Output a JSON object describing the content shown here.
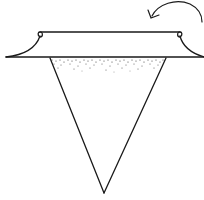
{
  "diagram": {
    "type": "line-illustration",
    "colors": {
      "stroke": "#1a1a1a",
      "stipple": "#444444",
      "background": "#ffffff"
    },
    "elements": [
      {
        "id": "brim-top",
        "shape": "line",
        "from": [
          40,
          32
        ],
        "to": [
          180,
          32
        ]
      },
      {
        "id": "brim-bottom",
        "shape": "line",
        "from": [
          6,
          57
        ],
        "to": [
          204,
          57
        ]
      },
      {
        "id": "cone",
        "shape": "triangle",
        "points": [
          [
            50,
            58
          ],
          [
            166,
            58
          ],
          [
            104,
            193
          ]
        ]
      },
      {
        "id": "stippling",
        "shape": "dot-fill",
        "region": "top band of cone",
        "y_range": [
          58,
          72
        ]
      },
      {
        "id": "rotation-arrow",
        "shape": "curved-arrow",
        "direction": "counter-clockwise",
        "arrowhead_at": [
          150,
          18
        ]
      }
    ],
    "labels": []
  }
}
